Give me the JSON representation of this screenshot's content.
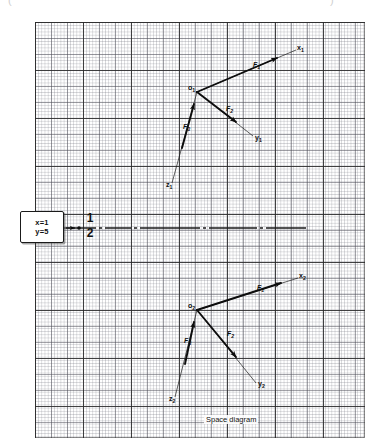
{
  "figure": {
    "caption": "Space diagram",
    "top_sliver_left": "(",
    "top_sliver_right": ")"
  },
  "callout": {
    "line1": "x=1",
    "line2": "y=5"
  },
  "scale_fraction": {
    "numerator": "1",
    "denominator": "2"
  },
  "diagrams": [
    {
      "name": "upper-space-diagram",
      "origin_label": "o",
      "origin_sub": "1",
      "axes": [
        {
          "name": "x-axis",
          "label": "x",
          "sub": "1"
        },
        {
          "name": "y-axis",
          "label": "y",
          "sub": "1"
        },
        {
          "name": "z-axis",
          "label": "z",
          "sub": "1"
        }
      ],
      "forces": [
        {
          "name": "force-1",
          "label": "F",
          "sub": "1"
        },
        {
          "name": "force-2",
          "label": "F",
          "sub": "2"
        },
        {
          "name": "force-3",
          "label": "F",
          "sub": "3"
        }
      ]
    },
    {
      "name": "lower-space-diagram",
      "origin_label": "o",
      "origin_sub": "2",
      "axes": [
        {
          "name": "x-axis",
          "label": "x",
          "sub": "2"
        },
        {
          "name": "y-axis",
          "label": "y",
          "sub": "2"
        },
        {
          "name": "z-axis",
          "label": "z",
          "sub": "2"
        }
      ],
      "forces": [
        {
          "name": "force-1",
          "label": "F",
          "sub": "1"
        },
        {
          "name": "force-2",
          "label": "F",
          "sub": "2"
        },
        {
          "name": "force-3",
          "label": "F",
          "sub": "3"
        }
      ]
    }
  ],
  "colors": {
    "ink": "#0d0d0d",
    "grid_fine": "#787a84",
    "grid_major": "#282828",
    "paper": "#ffffff"
  }
}
